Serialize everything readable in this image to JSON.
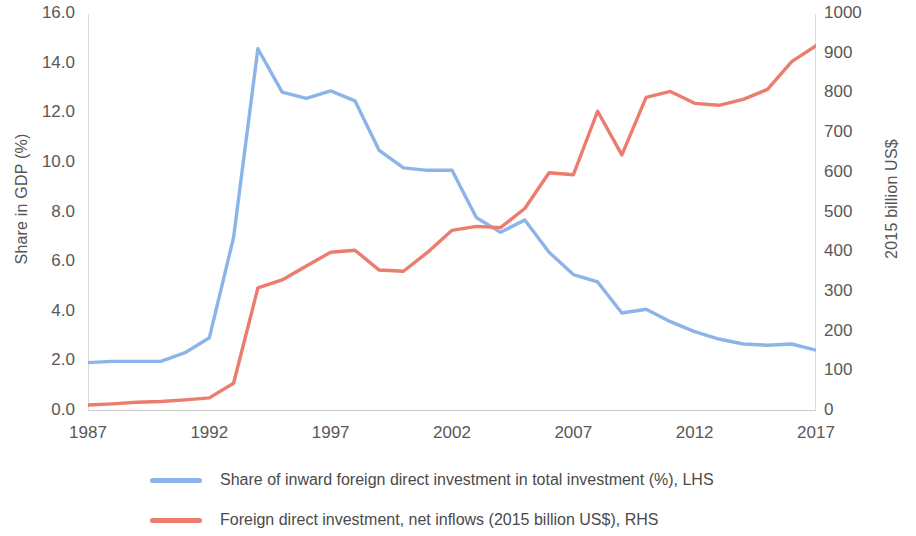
{
  "chart_data": {
    "type": "line",
    "title": "",
    "xlabel": "",
    "x": [
      1987,
      1988,
      1989,
      1990,
      1991,
      1992,
      1993,
      1994,
      1995,
      1996,
      1997,
      1998,
      1999,
      2000,
      2001,
      2002,
      2003,
      2004,
      2005,
      2006,
      2007,
      2008,
      2009,
      2010,
      2011,
      2012,
      2013,
      2014,
      2015,
      2016,
      2017
    ],
    "xticks": [
      "1987",
      "1992",
      "1997",
      "2002",
      "2007",
      "2012",
      "2017"
    ],
    "xlim": [
      1987,
      2017
    ],
    "grid": false,
    "legend_position": "bottom",
    "axes": {
      "left": {
        "label": "Share in GDP (%)",
        "lim": [
          0,
          16
        ],
        "ticks": [
          "0.0",
          "2.0",
          "4.0",
          "6.0",
          "8.0",
          "10.0",
          "12.0",
          "14.0",
          "16.0"
        ],
        "tick_values": [
          0,
          2,
          4,
          6,
          8,
          10,
          12,
          14,
          16
        ]
      },
      "right": {
        "label": "2015 billion US$",
        "lim": [
          0,
          1000
        ],
        "ticks": [
          "0",
          "100",
          "200",
          "300",
          "400",
          "500",
          "600",
          "700",
          "800",
          "900",
          "1000"
        ],
        "tick_values": [
          0,
          100,
          200,
          300,
          400,
          500,
          600,
          700,
          800,
          900,
          1000
        ]
      }
    },
    "series": [
      {
        "name": "Share of inward foreign direct investment in total investment (%), LHS",
        "axis": "left",
        "color": "#8CB4E8",
        "values": [
          1.95,
          2.0,
          2.0,
          2.0,
          2.35,
          2.95,
          7.0,
          14.6,
          12.85,
          12.6,
          12.9,
          12.5,
          10.5,
          9.8,
          9.7,
          9.7,
          7.8,
          7.2,
          7.7,
          6.4,
          5.5,
          5.2,
          3.95,
          4.1,
          3.6,
          3.2,
          2.9,
          2.7,
          2.65,
          2.7,
          2.45
        ]
      },
      {
        "name": "Foreign direct investment, net inflows (2015 billion US$), RHS",
        "axis": "right",
        "color": "#EC7C6E",
        "values": [
          15,
          18,
          22,
          24,
          28,
          33,
          70,
          310,
          330,
          365,
          400,
          405,
          355,
          352,
          400,
          455,
          465,
          462,
          510,
          600,
          595,
          755,
          645,
          790,
          805,
          775,
          770,
          785,
          810,
          880,
          920
        ]
      }
    ]
  },
  "legend": {
    "items": [
      {
        "label": "Share of inward foreign direct investment in total investment (%), LHS",
        "color": "#8CB4E8"
      },
      {
        "label": "Foreign direct investment, net inflows (2015 billion US$), RHS",
        "color": "#EC7C6E"
      }
    ]
  }
}
